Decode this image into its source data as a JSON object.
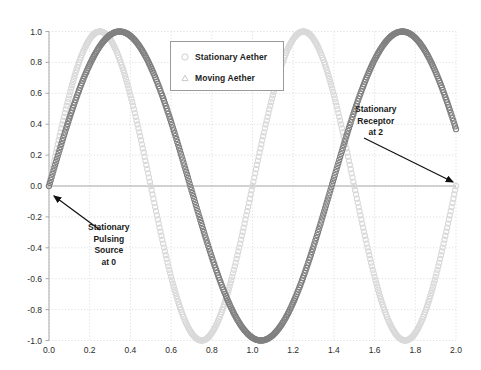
{
  "chart_data": {
    "type": "line",
    "title": "",
    "xlabel": "",
    "ylabel": "",
    "xlim": [
      0.0,
      2.0
    ],
    "ylim": [
      -1.0,
      1.0
    ],
    "grid": true,
    "grid_style": "dotted",
    "legend_position": "upper center",
    "xticks": [
      "0.0",
      "0.2",
      "0.4",
      "0.6",
      "0.8",
      "1.0",
      "1.2",
      "1.4",
      "1.6",
      "1.8",
      "2.0"
    ],
    "xtick_values": [
      0.0,
      0.2,
      0.4,
      0.6,
      0.8,
      1.0,
      1.2,
      1.4,
      1.6,
      1.8,
      2.0
    ],
    "yticks": [
      "1.0",
      "0.8",
      "0.6",
      "0.4",
      "0.2",
      "0.0",
      "-0.2",
      "-0.4",
      "-0.6",
      "-0.8",
      "-1.0"
    ],
    "ytick_values": [
      1.0,
      0.8,
      0.6,
      0.4,
      0.2,
      0.0,
      -0.2,
      -0.4,
      -0.6,
      -0.8,
      -1.0
    ],
    "marker": "o",
    "series": [
      {
        "name": "Stationary Aether",
        "color": "#d9d9d9",
        "marker": "o",
        "amplitude": 1.0,
        "period": 1.0,
        "phase": 0.0,
        "peaks_x": [
          0.25,
          1.25
        ],
        "troughs_x": [
          0.75,
          1.75
        ],
        "zeros_x": [
          0.0,
          0.5,
          1.0,
          1.5,
          2.0
        ]
      },
      {
        "name": "Moving Aether",
        "color": "#808080",
        "marker": "o",
        "amplitude": 1.0,
        "period": 1.3888,
        "phase": 0.0,
        "peaks_x": [
          0.347,
          1.736
        ],
        "troughs_x": [
          1.042
        ],
        "zeros_x": [
          0.0,
          0.694,
          1.389,
          2.0
        ]
      }
    ],
    "annotations": [
      {
        "id": "source",
        "text_lines": [
          "Stationary",
          "Pulsing",
          "Source",
          "at 0"
        ],
        "point_x": 0.0,
        "point_y": 0.0
      },
      {
        "id": "receptor",
        "text_lines": [
          "Stationary",
          "Receptor",
          "at 2"
        ],
        "point_x": 2.0,
        "point_y": 0.0
      }
    ]
  },
  "legend": {
    "items": [
      {
        "label": "Stationary Aether",
        "color": "#d9d9d9"
      },
      {
        "label": "Moving Aether",
        "color": "#c8c8c8"
      }
    ]
  }
}
